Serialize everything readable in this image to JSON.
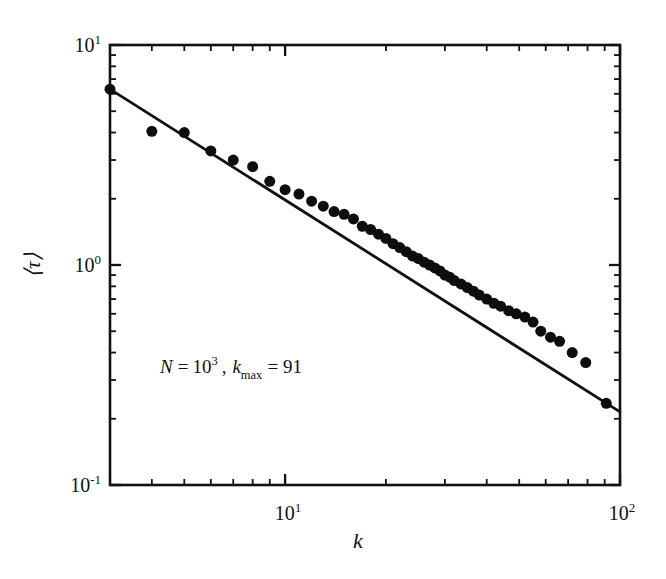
{
  "figure": {
    "background_color": "#ffffff",
    "ink_color": "#111111",
    "marker_color": "#0d0d0d"
  },
  "axes": {
    "x": {
      "label": "k",
      "scale": "log",
      "range": [
        3.0,
        100.0
      ],
      "major_ticks": [
        10,
        100
      ],
      "major_tick_labels": [
        "10",
        "10"
      ],
      "major_tick_exponents": [
        "1",
        "2"
      ],
      "minor_ticks": [
        4,
        5,
        6,
        7,
        8,
        9,
        20,
        30,
        40,
        50,
        60,
        70,
        80,
        90
      ]
    },
    "y": {
      "label": "⟨τ⟩",
      "scale": "log",
      "range": [
        0.1,
        10.0
      ],
      "major_ticks": [
        0.1,
        1,
        10
      ],
      "major_tick_labels": [
        "10",
        "10",
        "10"
      ],
      "major_tick_exponents": [
        "-1",
        "0",
        "1"
      ],
      "minor_ticks": [
        0.2,
        0.3,
        0.4,
        0.5,
        0.6,
        0.7,
        0.8,
        0.9,
        2,
        3,
        4,
        5,
        6,
        7,
        8,
        9
      ]
    }
  },
  "annotation": {
    "text": "N = 10³ , k_max = 91",
    "n_symbol": "N",
    "equals": "=",
    "n_base": "10",
    "n_exponent": "3",
    "comma": ",",
    "k_symbol": "k",
    "k_subscript": "max",
    "k_equals": "=",
    "k_max_value": "91"
  },
  "chart_data": {
    "type": "scatter",
    "title": "",
    "xlabel": "k",
    "ylabel": "⟨τ⟩",
    "xscale": "log",
    "yscale": "log",
    "xlim": [
      3.0,
      100.0
    ],
    "ylim": [
      0.1,
      10.0
    ],
    "grid": false,
    "legend": "none",
    "annotations": [
      "N = 10^3 , k_max = 91"
    ],
    "series": [
      {
        "name": "⟨τ⟩ vs k (simulation)",
        "type": "scatter",
        "marker": "filled-circle",
        "marker_size_px": 11,
        "color": "#0d0d0d",
        "x": [
          3.0,
          4.0,
          5.0,
          6.0,
          7.0,
          8.0,
          9.0,
          10.0,
          11.0,
          12.0,
          13.0,
          14.0,
          15.0,
          16.0,
          17.0,
          18.0,
          19.0,
          20.0,
          21.0,
          22.0,
          23.0,
          24.0,
          25.0,
          26.0,
          27.0,
          28.0,
          29.0,
          30.0,
          31.0,
          32.0,
          33.5,
          35.0,
          36.5,
          38.0,
          40.0,
          42.0,
          44.0,
          46.5,
          49.0,
          52.0,
          55.0,
          58.0,
          62.0,
          66.0,
          72.0,
          79.0,
          91.0
        ],
        "y": [
          6.3,
          4.05,
          4.0,
          3.3,
          3.0,
          2.8,
          2.4,
          2.2,
          2.1,
          1.95,
          1.85,
          1.75,
          1.7,
          1.62,
          1.5,
          1.45,
          1.38,
          1.32,
          1.25,
          1.2,
          1.15,
          1.1,
          1.07,
          1.03,
          1.0,
          0.97,
          0.94,
          0.9,
          0.88,
          0.85,
          0.82,
          0.79,
          0.76,
          0.73,
          0.7,
          0.67,
          0.65,
          0.62,
          0.6,
          0.58,
          0.55,
          0.5,
          0.47,
          0.45,
          0.4,
          0.36,
          0.235
        ]
      },
      {
        "name": "power-law fit",
        "type": "line",
        "color": "#111111",
        "line_width_px": 2.8,
        "fit_exponent": -0.95,
        "x": [
          3.0,
          100.0
        ],
        "y": [
          6.3,
          0.215
        ]
      }
    ]
  }
}
